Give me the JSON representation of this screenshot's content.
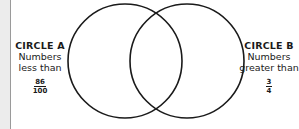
{
  "diagram": {
    "type": "venn",
    "circle_a": {
      "title": "CIRCLE A",
      "description": "Numbers less than",
      "desc_line1": "Numbers",
      "desc_line2": "less than",
      "fraction": {
        "numerator": "86",
        "denominator": "100"
      }
    },
    "circle_b": {
      "title": "CIRCLE B",
      "description": "Numbers greater than",
      "desc_line1": "Numbers",
      "desc_line2": "greater than",
      "fraction": {
        "numerator": "3",
        "denominator": "4"
      }
    },
    "stroke_color": "#1a1a1a",
    "background_color": "#ffffff"
  }
}
